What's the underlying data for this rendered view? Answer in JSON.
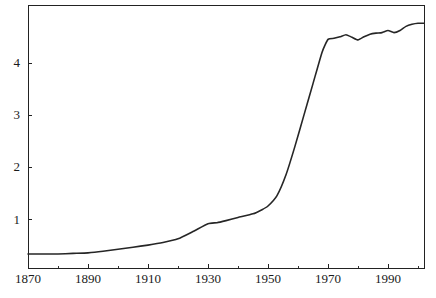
{
  "chart_data": {
    "type": "line",
    "title": "",
    "subtitle": "",
    "xlabel": "",
    "ylabel": "",
    "xlim": [
      1870,
      2002
    ],
    "ylim": [
      0.06,
      5.11
    ],
    "grid": false,
    "legend": null,
    "legend_position": "none",
    "xticks": [
      1870,
      1890,
      1910,
      1930,
      1950,
      1970,
      1990
    ],
    "xtick_labels": [
      "1870",
      "1890",
      "1910",
      "1930",
      "1950",
      "1970",
      "1990"
    ],
    "xminor_ticks": [
      1880,
      1900,
      1920,
      1940,
      1960,
      1980,
      2000
    ],
    "yticks": [
      1,
      2,
      3,
      4
    ],
    "ytick_labels": [
      "1",
      "2",
      "3",
      "4"
    ],
    "yminor_ticks": [],
    "line_color": "#262626",
    "line_width": 1.6,
    "frame_color": "#222222",
    "background_color": "#ffffff",
    "series": [
      {
        "name": "series-1",
        "x": [
          1870,
          1875,
          1880,
          1885,
          1890,
          1895,
          1900,
          1905,
          1910,
          1915,
          1920,
          1925,
          1930,
          1933,
          1936,
          1940,
          1945,
          1948,
          1950,
          1953,
          1956,
          1959,
          1962,
          1965,
          1968,
          1970,
          1972,
          1974,
          1976,
          1978,
          1980,
          1982,
          1984,
          1986,
          1988,
          1990,
          1992,
          1994,
          1996,
          1998,
          2000,
          2002
        ],
        "y": [
          0.33,
          0.33,
          0.33,
          0.34,
          0.35,
          0.38,
          0.42,
          0.46,
          0.5,
          0.55,
          0.62,
          0.76,
          0.91,
          0.93,
          0.97,
          1.03,
          1.1,
          1.18,
          1.25,
          1.45,
          1.85,
          2.4,
          3.0,
          3.6,
          4.2,
          4.45,
          4.47,
          4.5,
          4.54,
          4.49,
          4.44,
          4.5,
          4.55,
          4.57,
          4.58,
          4.62,
          4.58,
          4.62,
          4.7,
          4.74,
          4.76,
          4.76
        ]
      }
    ]
  },
  "geometry": {
    "plot_left": 28,
    "plot_right": 424,
    "plot_top": 5,
    "plot_bottom": 268,
    "major_tick_len": 4,
    "minor_tick_len": 2,
    "x_label_y": 283,
    "y_label_x": 20
  }
}
